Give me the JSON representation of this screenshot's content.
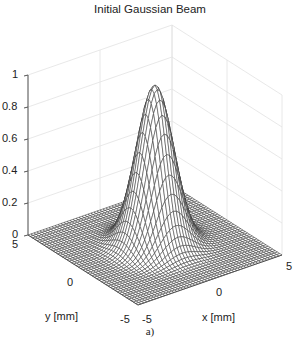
{
  "chart_data": {
    "type": "surface",
    "title": "Initial Gaussian Beam",
    "xlabel": "x [mm]",
    "ylabel": "y [mm]",
    "zlabel": "",
    "xlim": [
      -5,
      5
    ],
    "ylim": [
      -5,
      5
    ],
    "zlim": [
      0,
      1
    ],
    "x_ticks": [
      "-5",
      "0",
      "5"
    ],
    "y_ticks": [
      "-5",
      "0",
      "5"
    ],
    "z_ticks": [
      "0",
      "0.2",
      "0.4",
      "0.6",
      "0.8",
      "1"
    ],
    "function": "z = exp(-(x^2 + y^2)/w^2), peak 1 at (0,0)",
    "peak": {
      "x": 0,
      "y": 0,
      "z": 1
    },
    "grid": true,
    "caption": "a)"
  },
  "labels": {
    "title": "Initial Gaussian Beam",
    "xlabel": "x [mm]",
    "ylabel": "y [mm]",
    "caption": "a)",
    "z_ticks": [
      "1",
      "0.8",
      "0.6",
      "0.4",
      "0.2",
      "0"
    ],
    "y_ticks": [
      "5",
      "0",
      "-5"
    ],
    "x_ticks": [
      "-5",
      "0",
      "5"
    ]
  }
}
